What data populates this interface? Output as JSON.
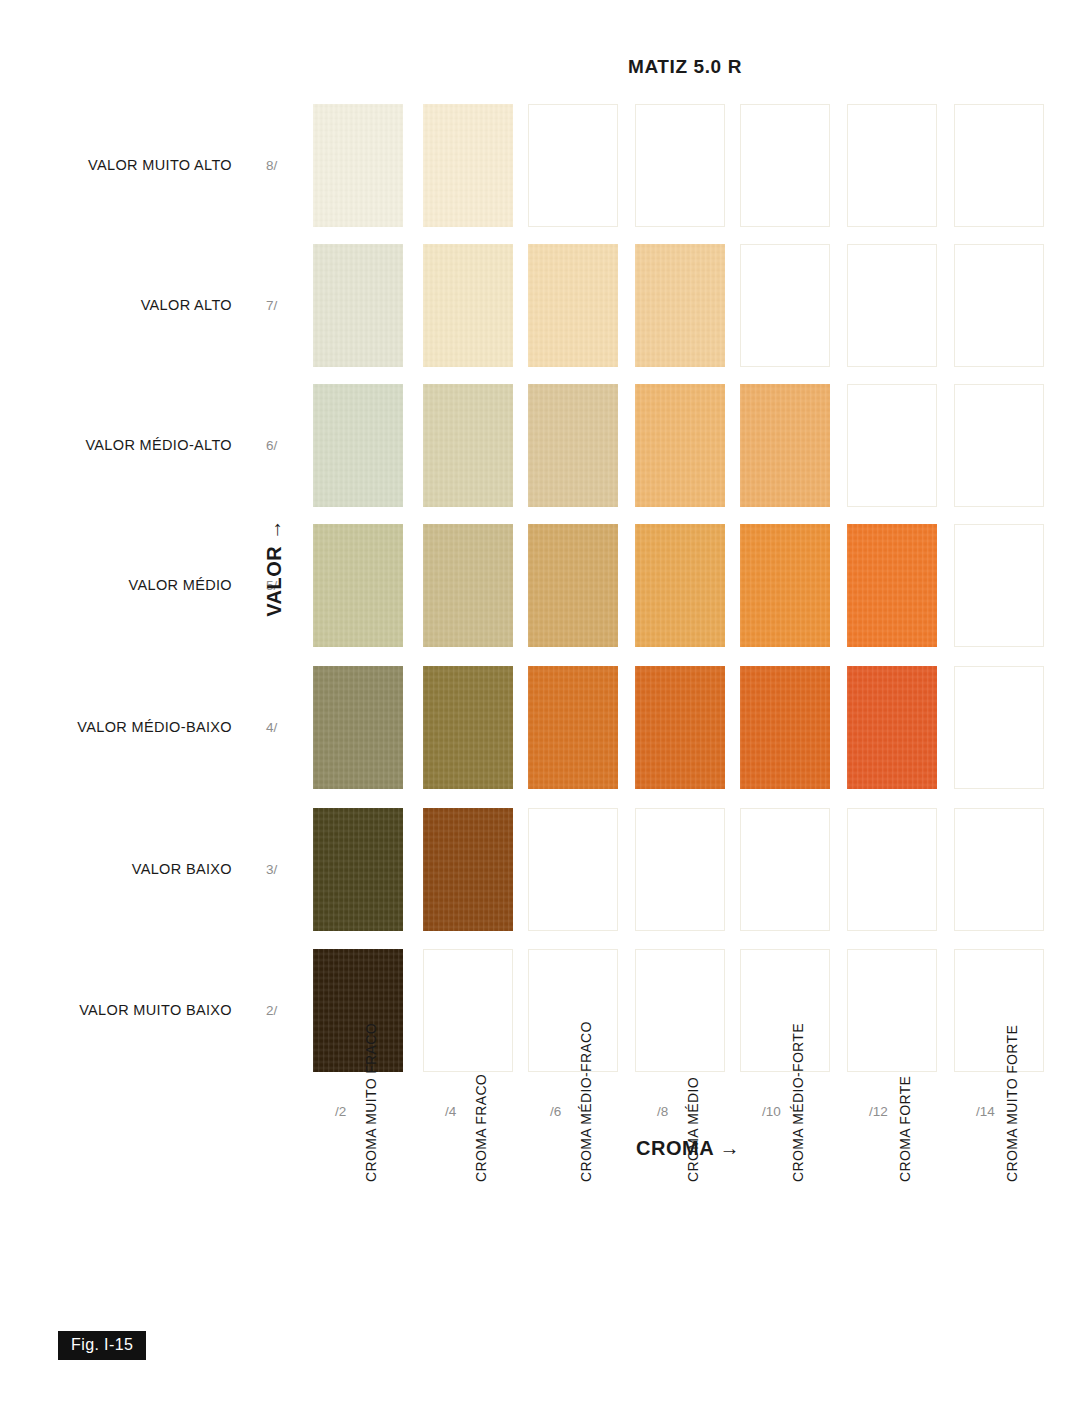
{
  "title": "MATIZ 5.0 R",
  "figure_caption": "Fig. I-15",
  "axes": {
    "value_axis_label": "VALOR →",
    "chroma_axis_label": "CROMA →"
  },
  "rows": [
    {
      "label": "VALOR MUITO ALTO",
      "tick": "8/"
    },
    {
      "label": "VALOR ALTO",
      "tick": "7/"
    },
    {
      "label": "VALOR MÉDIO-ALTO",
      "tick": "6/"
    },
    {
      "label": "VALOR MÉDIO",
      "tick": "5/"
    },
    {
      "label": "VALOR MÉDIO-BAIXO",
      "tick": "4/"
    },
    {
      "label": "VALOR BAIXO",
      "tick": "3/"
    },
    {
      "label": "VALOR MUITO BAIXO",
      "tick": "2/"
    }
  ],
  "columns": [
    {
      "tick": "/2",
      "label": "CROMA MUITO FRACO"
    },
    {
      "tick": "/4",
      "label": "CROMA FRACO"
    },
    {
      "tick": "/6",
      "label": "CROMA MÉDIO-FRACO"
    },
    {
      "tick": "/8",
      "label": "CROMA MÉDIO"
    },
    {
      "tick": "/10",
      "label": "CROMA MÉDIO-FORTE"
    },
    {
      "tick": "/12",
      "label": "CROMA FORTE"
    },
    {
      "tick": "/14",
      "label": "CROMA MUITO FORTE"
    }
  ],
  "chart_data": {
    "type": "heatmap",
    "title": "MATIZ 5.0 R",
    "xlabel": "CROMA →",
    "ylabel": "VALOR →",
    "x": [
      "/2",
      "/4",
      "/6",
      "/8",
      "/10",
      "/12",
      "/14"
    ],
    "y": [
      "8/",
      "7/",
      "6/",
      "5/",
      "4/",
      "3/",
      "2/"
    ],
    "grid": false,
    "legend": "none",
    "notation_hue": "5.0 R",
    "cells": [
      {
        "value": "8/",
        "chroma": "/2",
        "notation": "5.0R 8/2",
        "color": "#f2efdf",
        "present": true
      },
      {
        "value": "8/",
        "chroma": "/4",
        "notation": "5.0R 8/4",
        "color": "#f7ecd2",
        "present": true
      },
      {
        "value": "8/",
        "chroma": "/6",
        "notation": "5.0R 8/6",
        "color": "#ffffff",
        "present": false
      },
      {
        "value": "8/",
        "chroma": "/8",
        "notation": "5.0R 8/8",
        "color": "#ffffff",
        "present": false
      },
      {
        "value": "8/",
        "chroma": "/10",
        "notation": "5.0R 8/10",
        "color": "#ffffff",
        "present": false
      },
      {
        "value": "8/",
        "chroma": "/12",
        "notation": "5.0R 8/12",
        "color": "#ffffff",
        "present": false
      },
      {
        "value": "8/",
        "chroma": "/14",
        "notation": "5.0R 8/14",
        "color": "#ffffff",
        "present": false
      },
      {
        "value": "7/",
        "chroma": "/2",
        "notation": "5.0R 7/2",
        "color": "#e4e4d2",
        "present": true
      },
      {
        "value": "7/",
        "chroma": "/4",
        "notation": "5.0R 7/4",
        "color": "#f3e6c4",
        "present": true
      },
      {
        "value": "7/",
        "chroma": "/6",
        "notation": "5.0R 7/6",
        "color": "#f4dcb0",
        "present": true
      },
      {
        "value": "7/",
        "chroma": "/8",
        "notation": "5.0R 7/8",
        "color": "#f2cf9a",
        "present": true
      },
      {
        "value": "7/",
        "chroma": "/10",
        "notation": "5.0R 7/10",
        "color": "#ffffff",
        "present": false
      },
      {
        "value": "7/",
        "chroma": "/12",
        "notation": "5.0R 7/12",
        "color": "#ffffff",
        "present": false
      },
      {
        "value": "7/",
        "chroma": "/14",
        "notation": "5.0R 7/14",
        "color": "#ffffff",
        "present": false
      },
      {
        "value": "6/",
        "chroma": "/2",
        "notation": "5.0R 6/2",
        "color": "#d6dbc6",
        "present": true
      },
      {
        "value": "6/",
        "chroma": "/4",
        "notation": "5.0R 6/4",
        "color": "#d9d2ae",
        "present": true
      },
      {
        "value": "6/",
        "chroma": "/6",
        "notation": "5.0R 6/6",
        "color": "#dcc79b",
        "present": true
      },
      {
        "value": "6/",
        "chroma": "/8",
        "notation": "5.0R 6/8",
        "color": "#efb872",
        "present": true
      },
      {
        "value": "6/",
        "chroma": "/10",
        "notation": "5.0R 6/10",
        "color": "#eeb06a",
        "present": true
      },
      {
        "value": "6/",
        "chroma": "/12",
        "notation": "5.0R 6/12",
        "color": "#ffffff",
        "present": false
      },
      {
        "value": "6/",
        "chroma": "/14",
        "notation": "5.0R 6/14",
        "color": "#ffffff",
        "present": false
      },
      {
        "value": "5/",
        "chroma": "/2",
        "notation": "5.0R 5/2",
        "color": "#c8c69c",
        "present": true
      },
      {
        "value": "5/",
        "chroma": "/4",
        "notation": "5.0R 5/4",
        "color": "#cbbc8d",
        "present": true
      },
      {
        "value": "5/",
        "chroma": "/6",
        "notation": "5.0R 5/6",
        "color": "#d3ab69",
        "present": true
      },
      {
        "value": "5/",
        "chroma": "/8",
        "notation": "5.0R 5/8",
        "color": "#e8a955",
        "present": true
      },
      {
        "value": "5/",
        "chroma": "/10",
        "notation": "5.0R 5/10",
        "color": "#ec9239",
        "present": true
      },
      {
        "value": "5/",
        "chroma": "/12",
        "notation": "5.0R 5/12",
        "color": "#ef7a2b",
        "present": true
      },
      {
        "value": "5/",
        "chroma": "/14",
        "notation": "5.0R 5/14",
        "color": "#ffffff",
        "present": false
      },
      {
        "value": "4/",
        "chroma": "/2",
        "notation": "5.0R 4/2",
        "color": "#8f8a63",
        "present": true
      },
      {
        "value": "4/",
        "chroma": "/4",
        "notation": "5.0R 4/4",
        "color": "#8d7a3c",
        "present": true
      },
      {
        "value": "4/",
        "chroma": "/6",
        "notation": "5.0R 4/6",
        "color": "#d77526",
        "present": true
      },
      {
        "value": "4/",
        "chroma": "/8",
        "notation": "5.0R 4/8",
        "color": "#d86c22",
        "present": true
      },
      {
        "value": "4/",
        "chroma": "/10",
        "notation": "5.0R 4/10",
        "color": "#dd6a22",
        "present": true
      },
      {
        "value": "4/",
        "chroma": "/12",
        "notation": "5.0R 4/12",
        "color": "#e35c28",
        "present": true
      },
      {
        "value": "4/",
        "chroma": "/14",
        "notation": "5.0R 4/14",
        "color": "#ffffff",
        "present": false
      },
      {
        "value": "3/",
        "chroma": "/2",
        "notation": "5.0R 3/2",
        "color": "#4c451f",
        "present": true
      },
      {
        "value": "3/",
        "chroma": "/4",
        "notation": "5.0R 3/4",
        "color": "#8a4a16",
        "present": true
      },
      {
        "value": "3/",
        "chroma": "/6",
        "notation": "5.0R 3/6",
        "color": "#ffffff",
        "present": false
      },
      {
        "value": "3/",
        "chroma": "/8",
        "notation": "5.0R 3/8",
        "color": "#ffffff",
        "present": false
      },
      {
        "value": "3/",
        "chroma": "/10",
        "notation": "5.0R 3/10",
        "color": "#ffffff",
        "present": false
      },
      {
        "value": "3/",
        "chroma": "/12",
        "notation": "5.0R 3/12",
        "color": "#ffffff",
        "present": false
      },
      {
        "value": "3/",
        "chroma": "/14",
        "notation": "5.0R 3/14",
        "color": "#ffffff",
        "present": false
      },
      {
        "value": "2/",
        "chroma": "/2",
        "notation": "5.0R 2/2",
        "color": "#32220e",
        "present": true
      },
      {
        "value": "2/",
        "chroma": "/4",
        "notation": "5.0R 2/4",
        "color": "#ffffff",
        "present": false
      },
      {
        "value": "2/",
        "chroma": "/6",
        "notation": "5.0R 2/6",
        "color": "#ffffff",
        "present": false
      },
      {
        "value": "2/",
        "chroma": "/8",
        "notation": "5.0R 2/8",
        "color": "#ffffff",
        "present": false
      },
      {
        "value": "2/",
        "chroma": "/10",
        "notation": "5.0R 2/10",
        "color": "#ffffff",
        "present": false
      },
      {
        "value": "2/",
        "chroma": "/12",
        "notation": "5.0R 2/12",
        "color": "#ffffff",
        "present": false
      },
      {
        "value": "2/",
        "chroma": "/14",
        "notation": "5.0R 2/14",
        "color": "#ffffff",
        "present": false
      }
    ]
  }
}
